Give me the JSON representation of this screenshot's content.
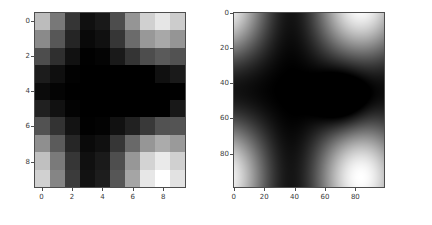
{
  "figure": {
    "background": "#ffffff",
    "width": 432,
    "height": 225,
    "colormap": "gray",
    "panel_count": 2
  },
  "chart_data": [
    {
      "type": "heatmap",
      "name": "coarse-grid-heatmap",
      "title": "",
      "xlabel": "",
      "ylabel": "",
      "colormap": "gray",
      "interpolation": "nearest",
      "origin": "upper",
      "grid": false,
      "legend": "none",
      "xlim": [
        -0.5,
        9.5
      ],
      "ylim": [
        9.5,
        -0.5
      ],
      "xticks": [
        0,
        2,
        4,
        6,
        8
      ],
      "yticks": [
        0,
        2,
        4,
        6,
        8
      ],
      "xticklabels": [
        "0",
        "2",
        "4",
        "6",
        "8"
      ],
      "yticklabels": [
        "0",
        "2",
        "4",
        "6",
        "8"
      ],
      "shape": [
        10,
        10
      ],
      "vmin": 0.04,
      "vmax": 1.0,
      "values": [
        [
          0.82,
          0.88,
          0.97,
          0.91,
          0.79,
          0.58,
          0.49,
          0.47,
          0.55,
          0.78
        ],
        [
          0.8,
          0.86,
          0.95,
          0.89,
          0.77,
          0.56,
          0.47,
          0.45,
          0.53,
          0.76
        ],
        [
          0.7,
          0.75,
          0.84,
          0.78,
          0.66,
          0.45,
          0.36,
          0.34,
          0.42,
          0.66
        ],
        [
          0.46,
          0.5,
          0.58,
          0.53,
          0.42,
          0.23,
          0.15,
          0.13,
          0.2,
          0.43
        ],
        [
          0.35,
          0.38,
          0.46,
          0.41,
          0.31,
          0.14,
          0.07,
          0.05,
          0.11,
          0.33
        ],
        [
          0.36,
          0.4,
          0.48,
          0.43,
          0.33,
          0.15,
          0.08,
          0.06,
          0.13,
          0.34
        ],
        [
          0.52,
          0.57,
          0.66,
          0.6,
          0.49,
          0.29,
          0.21,
          0.19,
          0.26,
          0.49
        ],
        [
          0.72,
          0.78,
          0.87,
          0.81,
          0.69,
          0.48,
          0.39,
          0.37,
          0.45,
          0.69
        ],
        [
          0.84,
          0.9,
          0.99,
          0.93,
          0.81,
          0.6,
          0.51,
          0.49,
          0.57,
          0.8
        ],
        [
          0.83,
          0.89,
          0.98,
          0.92,
          0.8,
          0.59,
          0.5,
          0.48,
          0.56,
          0.79
        ]
      ]
    },
    {
      "type": "heatmap",
      "name": "fine-grid-heatmap",
      "title": "",
      "xlabel": "",
      "ylabel": "",
      "colormap": "gray",
      "interpolation": "bilinear",
      "origin": "upper",
      "grid": false,
      "legend": "none",
      "xlim": [
        -0.5,
        99.5
      ],
      "ylim": [
        99.5,
        -0.5
      ],
      "xticks": [
        0,
        20,
        40,
        60,
        80
      ],
      "yticks": [
        0,
        20,
        40,
        60,
        80
      ],
      "xticklabels": [
        "0",
        "20",
        "40",
        "60",
        "80"
      ],
      "yticklabels": [
        "0",
        "20",
        "40",
        "60",
        "80"
      ],
      "shape": [
        100,
        100
      ],
      "vmin": 0.02,
      "vmax": 1.0,
      "minimum_location": [
        72,
        50
      ],
      "maximum_locations": [
        [
          20,
          85
        ],
        [
          22,
          4
        ]
      ],
      "values": [
        [
          0.88,
          0.93,
          0.99,
          0.94,
          0.82,
          0.61,
          0.5,
          0.48,
          0.57,
          0.81
        ],
        [
          0.8,
          0.86,
          0.95,
          0.89,
          0.77,
          0.56,
          0.47,
          0.45,
          0.53,
          0.76
        ],
        [
          0.68,
          0.74,
          0.83,
          0.77,
          0.64,
          0.43,
          0.34,
          0.32,
          0.4,
          0.64
        ],
        [
          0.48,
          0.53,
          0.61,
          0.55,
          0.44,
          0.25,
          0.16,
          0.14,
          0.22,
          0.45
        ],
        [
          0.36,
          0.39,
          0.47,
          0.42,
          0.31,
          0.13,
          0.05,
          0.03,
          0.1,
          0.33
        ],
        [
          0.38,
          0.42,
          0.5,
          0.45,
          0.34,
          0.16,
          0.08,
          0.06,
          0.13,
          0.36
        ],
        [
          0.55,
          0.6,
          0.69,
          0.63,
          0.51,
          0.31,
          0.22,
          0.2,
          0.28,
          0.52
        ],
        [
          0.76,
          0.82,
          0.91,
          0.85,
          0.73,
          0.52,
          0.43,
          0.41,
          0.49,
          0.73
        ],
        [
          0.9,
          0.96,
          1.0,
          0.98,
          0.86,
          0.64,
          0.54,
          0.52,
          0.6,
          0.84
        ],
        [
          0.86,
          0.92,
          0.98,
          0.93,
          0.81,
          0.6,
          0.5,
          0.48,
          0.56,
          0.8
        ]
      ]
    }
  ],
  "panels": [
    {
      "name": "left",
      "axes_rect": {
        "left": 34,
        "top": 12,
        "width": 152,
        "height": 176
      },
      "tick_font_size": 7
    },
    {
      "name": "right",
      "axes_rect": {
        "left": 233,
        "top": 12,
        "width": 152,
        "height": 176
      },
      "tick_font_size": 7
    }
  ]
}
